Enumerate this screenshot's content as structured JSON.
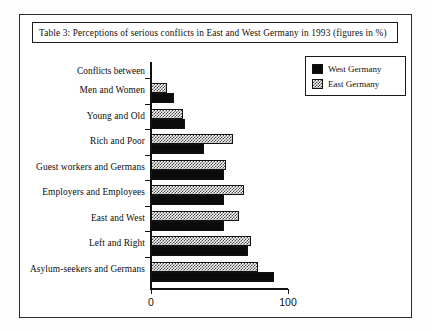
{
  "figure": {
    "title": "Table 3: Perceptions of serious conflicts in East and West Germany in 1993 (figures in %)",
    "header_label": "Conflicts between"
  },
  "legend": {
    "position": "top-right",
    "entries": [
      {
        "label": "West Germany",
        "swatch": "solid-black-swatch"
      },
      {
        "label": "East Germany",
        "swatch": "checkered-gray-swatch"
      }
    ]
  },
  "axis": {
    "x_ticks": [
      "0",
      "100"
    ],
    "x_tick_values": [
      0,
      100
    ]
  },
  "chart_data": {
    "type": "bar",
    "orientation": "horizontal",
    "grouped": true,
    "title": "Table 3: Perceptions of serious conflicts in East and West Germany in 1993 (figures in %)",
    "xlabel": "",
    "ylabel": "Conflicts between",
    "xlim": [
      0,
      100
    ],
    "grid": false,
    "legend_position": "top-right",
    "categories": [
      "Men and Women",
      "Young and Old",
      "Rich and Poor",
      "Guest workers and Germans",
      "Employers and Employees",
      "East and West",
      "Left and Right",
      "Asylum-seekers and Germans"
    ],
    "series": [
      {
        "name": "West Germany",
        "values": [
          17,
          25,
          39,
          53,
          53,
          53,
          71,
          90
        ]
      },
      {
        "name": "East Germany",
        "values": [
          12,
          23,
          60,
          55,
          68,
          64,
          73,
          78
        ]
      }
    ]
  }
}
